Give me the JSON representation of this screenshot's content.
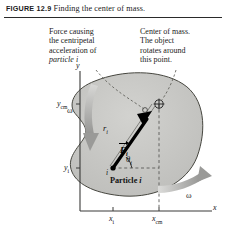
{
  "figure": {
    "label": "FIGURE 12.9",
    "caption": "Finding the center of mass."
  },
  "annotations": {
    "force_note_line1": "Force causing",
    "force_note_line2": "the centripetal",
    "force_note_line3": "acceleration of",
    "force_note_line4": "particle i",
    "com_note_line1": "Center of mass.",
    "com_note_line2": "The object",
    "com_note_line3": "rotates around",
    "com_note_line4": "this point."
  },
  "axes": {
    "y_axis_label": "y",
    "x_axis_label": "x",
    "y_cm_label": "y",
    "y_cm_sub": "cm",
    "y_i_label": "y",
    "y_i_sub": "i",
    "x_i_label": "x",
    "x_i_sub": "i",
    "x_cm_label": "x",
    "x_cm_sub": "cm"
  },
  "diagram": {
    "omega_top": "ω",
    "omega_bottom": "ω",
    "radius_label": "r",
    "radius_sub": "i",
    "force_label": "F",
    "force_sub": "i",
    "theta_label": "θ",
    "theta_sub": "i",
    "particle_label": "Particle ",
    "particle_sub": "i",
    "particle_marker": "i"
  },
  "colors": {
    "blob_fill": "#c9c9c6",
    "blob_edge": "#3a3a38",
    "arrow_gray": "#9a9a98",
    "axis": "#3a3a38",
    "vector_black": "#000000",
    "background": "#ffffff"
  }
}
